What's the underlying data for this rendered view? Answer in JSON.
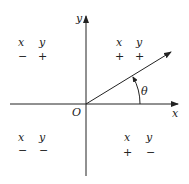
{
  "diagram": {
    "axes": {
      "x_label": "x",
      "y_label": "y",
      "origin_label": "O"
    },
    "angle": {
      "label": "θ"
    },
    "quadrants": [
      {
        "id": "II",
        "x_header": "x",
        "y_header": "y",
        "x_sign": "−",
        "y_sign": "+"
      },
      {
        "id": "I",
        "x_header": "x",
        "y_header": "y",
        "x_sign": "+",
        "y_sign": "+"
      },
      {
        "id": "III",
        "x_header": "x",
        "y_header": "y",
        "x_sign": "−",
        "y_sign": "−"
      },
      {
        "id": "IV",
        "x_header": "x",
        "y_header": "y",
        "x_sign": "+",
        "y_sign": "−"
      }
    ],
    "colors": {
      "line": "#222222",
      "background": "#ffffff"
    }
  }
}
